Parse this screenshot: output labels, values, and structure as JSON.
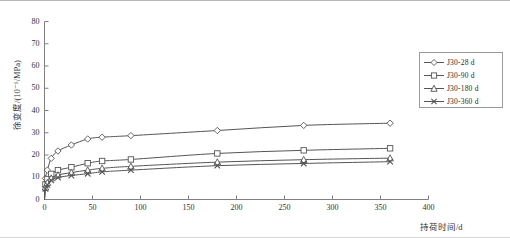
{
  "figure": {
    "background": "#ffffff",
    "line_color": "#555555",
    "axis_color": "#808080",
    "text_color": "#333333"
  },
  "axes": {
    "y_title": "徐变度/(10⁻⁶/MPa)",
    "x_title": "持荷时间/d",
    "y_ticks": [
      0,
      10,
      20,
      30,
      40,
      50,
      60,
      70,
      80
    ],
    "x_ticks": [
      0,
      50,
      100,
      150,
      200,
      250,
      300,
      350,
      400
    ],
    "xlim": [
      0,
      400
    ],
    "ylim": [
      0,
      80
    ],
    "grid": false
  },
  "legend": {
    "position": "right",
    "entries": [
      {
        "label": "J30-28 d",
        "marker": "diamond"
      },
      {
        "label": "J30-90 d",
        "marker": "square"
      },
      {
        "label": "J30-180 d",
        "marker": "triangle"
      },
      {
        "label": "J30-360 d",
        "marker": "x"
      }
    ]
  },
  "chart_data": {
    "type": "line",
    "title": "",
    "subtitle": "",
    "xlabel": "持荷时间/d",
    "ylabel": "徐变度/(10⁻⁶/MPa)",
    "xlim": [
      0,
      400
    ],
    "ylim": [
      0,
      80
    ],
    "xticks": [
      0,
      50,
      100,
      150,
      200,
      250,
      300,
      350,
      400
    ],
    "yticks": [
      0,
      10,
      20,
      30,
      40,
      50,
      60,
      70,
      80
    ],
    "grid": false,
    "legend_position": "right",
    "series": [
      {
        "name": "J30-28 d",
        "marker": "diamond",
        "x": [
          0,
          1,
          3,
          7,
          14,
          28,
          45,
          60,
          90,
          180,
          270,
          360
        ],
        "y": [
          0,
          9.5,
          13.2,
          18.5,
          21.8,
          24.5,
          27.2,
          28.0,
          28.7,
          31.0,
          33.3,
          34.3
        ]
      },
      {
        "name": "J30-90 d",
        "marker": "square",
        "x": [
          0,
          1,
          3,
          7,
          14,
          28,
          45,
          60,
          90,
          180,
          270,
          360
        ],
        "y": [
          0,
          6.8,
          9.2,
          11.5,
          13.2,
          14.5,
          16.3,
          17.3,
          18.0,
          20.7,
          22.1,
          23.0
        ]
      },
      {
        "name": "J30-180 d",
        "marker": "triangle",
        "x": [
          0,
          1,
          3,
          7,
          14,
          28,
          45,
          60,
          90,
          180,
          270,
          360
        ],
        "y": [
          0,
          5.5,
          7.6,
          9.6,
          11.0,
          12.1,
          13.2,
          14.0,
          14.9,
          16.8,
          17.9,
          18.6
        ]
      },
      {
        "name": "J30-360 d",
        "marker": "x",
        "x": [
          0,
          1,
          3,
          7,
          14,
          28,
          45,
          60,
          90,
          180,
          270,
          360
        ],
        "y": [
          0,
          4.8,
          6.6,
          8.6,
          9.9,
          10.8,
          11.6,
          12.4,
          13.2,
          15.2,
          16.2,
          17.0
        ]
      }
    ]
  }
}
